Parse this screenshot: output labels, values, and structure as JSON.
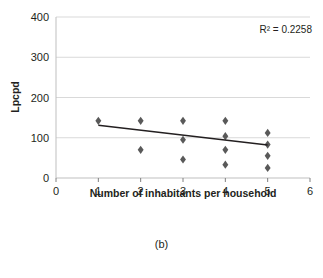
{
  "figure": {
    "caption": "(b)"
  },
  "chart_data": {
    "type": "scatter",
    "title": "",
    "xlabel": "Number of inhabitants per household",
    "ylabel": "Lpcpd",
    "xlim": [
      0,
      6
    ],
    "ylim": [
      0,
      400
    ],
    "xticks": [
      "0",
      "1",
      "2",
      "3",
      "4",
      "5",
      "6"
    ],
    "yticks": [
      "0",
      "100",
      "200",
      "300",
      "400"
    ],
    "grid": "horizontal",
    "legend": "none",
    "marker_shape": "diamond",
    "marker_color": "#595959",
    "annotations": [
      {
        "name": "r-squared",
        "text": "R² = 0.2258",
        "value": 0.2258
      }
    ],
    "points": [
      {
        "x": 1,
        "y": 142
      },
      {
        "x": 2,
        "y": 142
      },
      {
        "x": 2,
        "y": 70
      },
      {
        "x": 3,
        "y": 142
      },
      {
        "x": 3,
        "y": 95
      },
      {
        "x": 3,
        "y": 46
      },
      {
        "x": 4,
        "y": 142
      },
      {
        "x": 4,
        "y": 104
      },
      {
        "x": 4,
        "y": 70
      },
      {
        "x": 4,
        "y": 33
      },
      {
        "x": 5,
        "y": 112
      },
      {
        "x": 5,
        "y": 83
      },
      {
        "x": 5,
        "y": 55
      },
      {
        "x": 5,
        "y": 25
      }
    ],
    "trendline": {
      "type": "linear",
      "x_start": 1,
      "y_start": 131,
      "x_end": 5,
      "y_end": 82
    }
  }
}
